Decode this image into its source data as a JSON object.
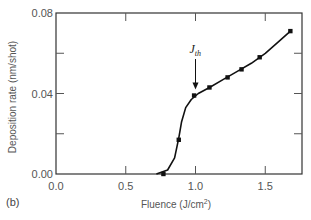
{
  "chart_data": {
    "type": "scatter",
    "title": "",
    "panel_label": "(b)",
    "xlabel": "Fluence (J/cm2)",
    "xlabel_main": "Fluence (J/cm",
    "xlabel_sup": "2",
    "xlabel_end": ")",
    "ylabel": "Deposition rate (nm/shot)",
    "xlim": [
      0.0,
      1.75
    ],
    "ylim": [
      0.0,
      0.08
    ],
    "x_ticks": [
      "0.0",
      "0.5",
      "1.0",
      "1.5"
    ],
    "y_ticks": [
      "0.00",
      "0.04",
      "0.08"
    ],
    "grid": false,
    "legend": null,
    "annotations": [
      {
        "text": "J_th",
        "display_main": "J",
        "display_sub": "th",
        "x": 1.0,
        "arrow_to_y": 0.039
      }
    ],
    "series": [
      {
        "name": "Measured",
        "marker": "square",
        "x": [
          0.77,
          0.88,
          0.99,
          1.1,
          1.23,
          1.33,
          1.46,
          1.68
        ],
        "y": [
          0.0,
          0.017,
          0.039,
          0.043,
          0.048,
          0.052,
          0.058,
          0.071
        ]
      },
      {
        "name": "Fit curve",
        "marker": "none",
        "x": [
          0.72,
          0.8,
          0.85,
          0.88,
          0.9,
          0.93,
          0.97,
          1.02,
          1.1,
          1.2,
          1.3,
          1.4,
          1.5,
          1.6,
          1.68
        ],
        "y": [
          0.0,
          0.002,
          0.008,
          0.018,
          0.026,
          0.033,
          0.037,
          0.04,
          0.043,
          0.047,
          0.051,
          0.055,
          0.06,
          0.066,
          0.071
        ]
      }
    ]
  }
}
